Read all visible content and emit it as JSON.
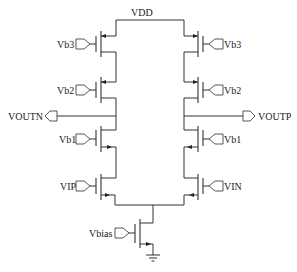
{
  "diagram": {
    "type": "circuit-schematic",
    "supply": {
      "label": "VDD"
    },
    "left_branch": {
      "transistors": [
        {
          "gate_label": "Vb3"
        },
        {
          "gate_label": "Vb2"
        },
        {
          "gate_label": "Vb1"
        },
        {
          "gate_label": "VIP"
        }
      ],
      "output_label": "VOUTN"
    },
    "right_branch": {
      "transistors": [
        {
          "gate_label": "Vb3"
        },
        {
          "gate_label": "Vb2"
        },
        {
          "gate_label": "Vb1"
        },
        {
          "gate_label": "VIN"
        }
      ],
      "output_label": "VOUTP"
    },
    "tail": {
      "gate_label": "Vbias"
    },
    "ground": {
      "symbol": "ground"
    }
  }
}
